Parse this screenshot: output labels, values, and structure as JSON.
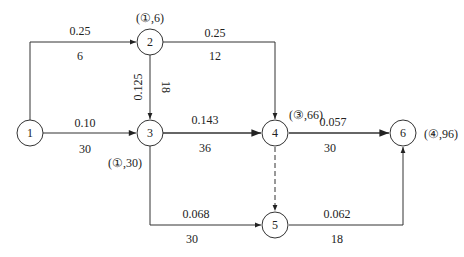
{
  "diagram": {
    "type": "network-graph",
    "nodes": [
      {
        "id": "1",
        "label": "1",
        "annotation": ""
      },
      {
        "id": "2",
        "label": "2",
        "annotation": "(①,6)"
      },
      {
        "id": "3",
        "label": "3",
        "annotation": "(①,30)"
      },
      {
        "id": "4",
        "label": "4",
        "annotation": "(③,66)"
      },
      {
        "id": "5",
        "label": "5",
        "annotation": ""
      },
      {
        "id": "6",
        "label": "6",
        "annotation": "(④,96)"
      }
    ],
    "edges": [
      {
        "from": "1",
        "to": "2",
        "top": "0.25",
        "bottom": "6",
        "style": "solid"
      },
      {
        "from": "1",
        "to": "3",
        "top": "0.10",
        "bottom": "30",
        "style": "solid"
      },
      {
        "from": "2",
        "to": "3",
        "left": "0.125",
        "right": "18",
        "style": "solid"
      },
      {
        "from": "2",
        "to": "4",
        "top": "0.25",
        "bottom": "12",
        "style": "solid"
      },
      {
        "from": "3",
        "to": "4",
        "top": "0.143",
        "bottom": "36",
        "style": "solid"
      },
      {
        "from": "3",
        "to": "5",
        "top": "0.068",
        "bottom": "30",
        "style": "solid"
      },
      {
        "from": "4",
        "to": "5",
        "style": "dashed"
      },
      {
        "from": "4",
        "to": "6",
        "top": "0.057",
        "bottom": "30",
        "style": "solid"
      },
      {
        "from": "5",
        "to": "6",
        "top": "0.062",
        "bottom": "18",
        "style": "solid"
      }
    ]
  }
}
